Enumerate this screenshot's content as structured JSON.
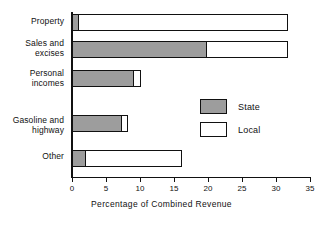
{
  "chart_data": {
    "type": "bar",
    "orientation": "horizontal",
    "stacked": true,
    "title": "",
    "xlabel": "Percentage of Combined Revenue",
    "ylabel": "",
    "xlim": [
      0,
      35
    ],
    "xticks": [
      0,
      5,
      10,
      15,
      20,
      25,
      30,
      35
    ],
    "xtick_labels": [
      "0",
      "5",
      "10",
      "15",
      "20",
      "25",
      "30",
      "35"
    ],
    "grid": false,
    "legend_position": "inside-right",
    "categories": [
      "Property",
      "Sales and\nexcises",
      "Personal\nincomes",
      "Gasoline and\nhighway",
      "Other"
    ],
    "series": [
      {
        "name": "State",
        "color": "#9d9d9d",
        "values": [
          1.0,
          19.9,
          9.1,
          7.4,
          2.1
        ]
      },
      {
        "name": "Local",
        "color": "#ffffff",
        "values": [
          30.8,
          11.9,
          1.0,
          0.8,
          14.1
        ]
      }
    ],
    "totals": [
      31.8,
      31.8,
      10.1,
      8.2,
      16.2
    ]
  },
  "legend": {
    "items": [
      {
        "label": "State",
        "swatch": "state"
      },
      {
        "label": "Local",
        "swatch": "local"
      }
    ]
  },
  "axis": {
    "x_title": "Percentage of Combined Revenue"
  }
}
